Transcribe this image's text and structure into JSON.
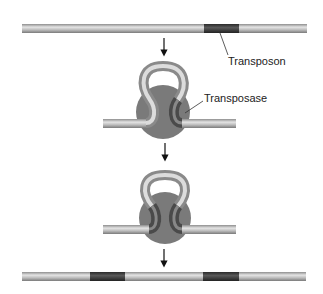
{
  "diagram": {
    "type": "process",
    "labels": {
      "transposon": "Transposon",
      "transposase": "Transposase"
    },
    "steps": [
      {
        "name": "dna-with-transposon",
        "description": "Linear DNA containing a transposon segment"
      },
      {
        "name": "transposase-binding",
        "description": "DNA loops and transposase binds transposon end"
      },
      {
        "name": "synaptic-complex",
        "description": "Transposase binds both ends of transposon"
      },
      {
        "name": "dna-after-transposition",
        "description": "Linear DNA with transposon copies at two sites"
      }
    ],
    "colors": {
      "dna": "#b8b8b8",
      "dna_highlight": "#e2e2e2",
      "transposon": "#3a3a3a",
      "transposase": "#7a7a7a",
      "arrow": "#111111"
    }
  }
}
